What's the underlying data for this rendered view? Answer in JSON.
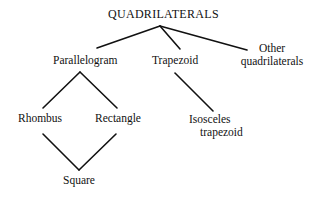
{
  "diagram": {
    "type": "hierarchy-tree",
    "nodes": {
      "root": {
        "label": "QUADRILATERALS"
      },
      "parallelogram": {
        "label": "Parallelogram"
      },
      "trapezoid": {
        "label": "Trapezoid"
      },
      "other": {
        "line1": "Other",
        "line2": "quadrilaterals"
      },
      "rhombus": {
        "label": "Rhombus"
      },
      "rectangle": {
        "label": "Rectangle"
      },
      "isosceles": {
        "line1": "Isosceles",
        "line2": "trapezoid"
      },
      "square": {
        "label": "Square"
      }
    },
    "edges": [
      [
        "QUADRILATERALS",
        "Parallelogram"
      ],
      [
        "QUADRILATERALS",
        "Trapezoid"
      ],
      [
        "QUADRILATERALS",
        "Other quadrilaterals"
      ],
      [
        "Parallelogram",
        "Rhombus"
      ],
      [
        "Parallelogram",
        "Rectangle"
      ],
      [
        "Trapezoid",
        "Isosceles trapezoid"
      ],
      [
        "Rhombus",
        "Square"
      ],
      [
        "Rectangle",
        "Square"
      ]
    ],
    "line_color": "#111111"
  }
}
